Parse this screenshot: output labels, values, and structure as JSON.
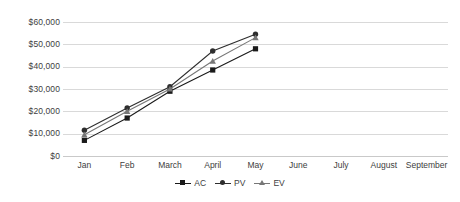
{
  "chart_data": {
    "type": "line",
    "title": "",
    "xlabel": "",
    "ylabel": "",
    "categories": [
      "Jan",
      "Feb",
      "March",
      "April",
      "May",
      "June",
      "July",
      "August",
      "September"
    ],
    "ylim": [
      0,
      60000
    ],
    "ytick_values": [
      0,
      10000,
      20000,
      30000,
      40000,
      50000,
      60000
    ],
    "ytick_labels": [
      "$0",
      "$10,000",
      "$20,000",
      "$30,000",
      "$40,000",
      "$50,000",
      "$60,000"
    ],
    "grid": true,
    "legend_position": "bottom",
    "series": [
      {
        "name": "AC",
        "marker": "square",
        "color": "#1a1a1a",
        "values": [
          7000,
          17000,
          29000,
          38500,
          48000,
          null,
          null,
          null,
          null
        ]
      },
      {
        "name": "PV",
        "marker": "circle",
        "color": "#2e2e2e",
        "values": [
          11500,
          21500,
          31000,
          47000,
          54500,
          null,
          null,
          null,
          null
        ]
      },
      {
        "name": "EV",
        "marker": "triangle",
        "color": "#777777",
        "values": [
          9500,
          20000,
          30000,
          42500,
          53000,
          null,
          null,
          null,
          null
        ]
      }
    ]
  },
  "legend": {
    "items": [
      {
        "label": "AC",
        "icon": "square-marker-icon"
      },
      {
        "label": "PV",
        "icon": "circle-marker-icon"
      },
      {
        "label": "EV",
        "icon": "triangle-marker-icon"
      }
    ]
  },
  "colors": {
    "background": "#ffffff",
    "gridline": "#d9d9d9",
    "axis": "#c9c9c9",
    "text": "#404040",
    "series_ac": "#1a1a1a",
    "series_pv": "#2e2e2e",
    "series_ev": "#777777"
  }
}
